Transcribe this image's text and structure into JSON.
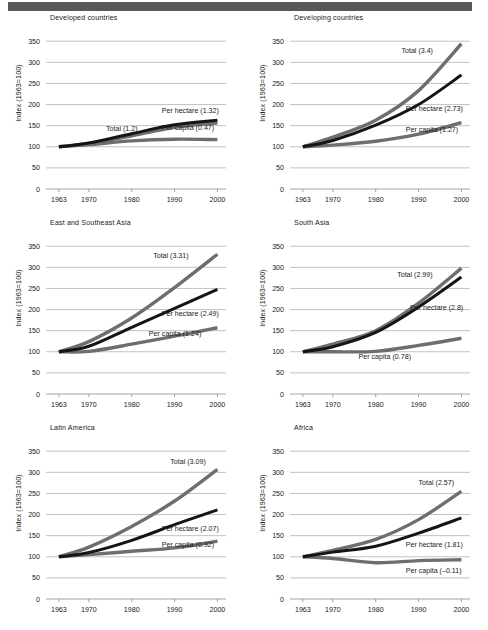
{
  "figure": {
    "y_axis_title": "Index (1963=100)",
    "y_ticks": [
      "0",
      "50",
      "100",
      "150",
      "200",
      "250",
      "300",
      "350"
    ],
    "x_ticks": [
      "1963",
      "1970",
      "1980",
      "1990",
      "2000"
    ],
    "colors": {
      "total": "#6e6e70",
      "per_hectare": "#151515",
      "per_capita": "#6e6e70",
      "gridline": "#a8a8aa",
      "top_rule": "#58585a",
      "text": "#1a1a1a"
    }
  },
  "chart_data": [
    {
      "type": "line",
      "title": "Developed countries",
      "xlabel": "",
      "ylabel": "Index (1963=100)",
      "x": [
        1963,
        1970,
        1980,
        1990,
        2000
      ],
      "xlim": [
        1960,
        2002
      ],
      "ylim": [
        0,
        360
      ],
      "yticks": [
        0,
        50,
        100,
        150,
        200,
        250,
        300,
        350
      ],
      "grid": true,
      "legend": "inline-annotations",
      "series": [
        {
          "name": "Total (1.2)",
          "label": "Total (1.2)",
          "values": [
            100,
            108,
            126,
            146,
            157
          ],
          "label_x": 1974,
          "label_y": 137
        },
        {
          "name": "Per hectare (1.32)",
          "label": "Per hectare (1.32)",
          "values": [
            100,
            109,
            131,
            152,
            163
          ],
          "label_x": 1987,
          "label_y": 180
        },
        {
          "name": "Per capita (0.47)",
          "label": "Per capita (0.47)",
          "values": [
            100,
            105,
            114,
            118,
            117
          ],
          "label_x": 1987,
          "label_y": 139
        }
      ]
    },
    {
      "type": "line",
      "title": "Developing countries",
      "xlabel": "",
      "ylabel": "Index (1963=100)",
      "x": [
        1963,
        1970,
        1980,
        1990,
        2000
      ],
      "xlim": [
        1960,
        2002
      ],
      "ylim": [
        0,
        360
      ],
      "yticks": [
        0,
        50,
        100,
        150,
        200,
        250,
        300,
        350
      ],
      "grid": true,
      "legend": "inline-annotations",
      "series": [
        {
          "name": "Total (3.4)",
          "label": "Total (3.4)",
          "values": [
            100,
            123,
            163,
            233,
            344
          ],
          "label_x": 1986,
          "label_y": 322
        },
        {
          "name": "Per hectare (2.73)",
          "label": "Per hectare (2.73)",
          "values": [
            100,
            115,
            151,
            200,
            270
          ],
          "label_x": 1987,
          "label_y": 185
        },
        {
          "name": "Per capita (1.27)",
          "label": "Per capita (1.27)",
          "values": [
            100,
            104,
            113,
            130,
            157
          ],
          "label_x": 1987,
          "label_y": 136
        }
      ]
    },
    {
      "type": "line",
      "title": "East and Southeast Asia",
      "xlabel": "",
      "ylabel": "Index (1963=100)",
      "x": [
        1963,
        1970,
        1980,
        1990,
        2000
      ],
      "xlim": [
        1960,
        2002
      ],
      "ylim": [
        0,
        360
      ],
      "yticks": [
        0,
        50,
        100,
        150,
        200,
        250,
        300,
        350
      ],
      "grid": true,
      "legend": "inline-annotations",
      "series": [
        {
          "name": "Total (3.31)",
          "label": "Total (3.31)",
          "values": [
            100,
            124,
            180,
            252,
            331
          ],
          "label_x": 1985,
          "label_y": 323
        },
        {
          "name": "Per hectare (2.49)",
          "label": "Per hectare (2.49)",
          "values": [
            100,
            113,
            158,
            203,
            248
          ],
          "label_x": 1987,
          "label_y": 184
        },
        {
          "name": "Per capita (1.24)",
          "label": "Per capita (1.24)",
          "values": [
            100,
            101,
            118,
            137,
            157
          ],
          "label_x": 1984,
          "label_y": 137
        }
      ]
    },
    {
      "type": "line",
      "title": "South Asia",
      "xlabel": "",
      "ylabel": "Index (1963=100)",
      "x": [
        1963,
        1970,
        1980,
        1990,
        2000
      ],
      "xlim": [
        1960,
        2002
      ],
      "ylim": [
        0,
        360
      ],
      "yticks": [
        0,
        50,
        100,
        150,
        200,
        250,
        300,
        350
      ],
      "grid": true,
      "legend": "inline-annotations",
      "series": [
        {
          "name": "Total (2.99)",
          "label": "Total (2.99)",
          "values": [
            100,
            118,
            150,
            215,
            298
          ],
          "label_x": 1985,
          "label_y": 278
        },
        {
          "name": "Per hectare (2.8)",
          "label": "Per hectare (2.8)",
          "values": [
            100,
            112,
            146,
            206,
            277
          ],
          "label_x": 1988,
          "label_y": 198
        },
        {
          "name": "Per capita (0.78)",
          "label": "Per capita (0.78)",
          "values": [
            100,
            100,
            101,
            115,
            132
          ],
          "label_x": 1976,
          "label_y": 84
        }
      ]
    },
    {
      "type": "line",
      "title": "Latin America",
      "xlabel": "",
      "ylabel": "Index (1963=100)",
      "x": [
        1963,
        1970,
        1980,
        1990,
        2000
      ],
      "xlim": [
        1960,
        2002
      ],
      "ylim": [
        0,
        360
      ],
      "yticks": [
        0,
        50,
        100,
        150,
        200,
        250,
        300,
        350
      ],
      "grid": true,
      "legend": "inline-annotations",
      "series": [
        {
          "name": "Total (3.09)",
          "label": "Total (3.09)",
          "values": [
            100,
            123,
            172,
            232,
            307
          ],
          "label_x": 1989,
          "label_y": 320
        },
        {
          "name": "Per hectare (2.07)",
          "label": "Per hectare (2.07)",
          "values": [
            100,
            110,
            139,
            176,
            211
          ],
          "label_x": 1987,
          "label_y": 160
        },
        {
          "name": "Per capita (0.92)",
          "label": "Per capita (0.92)",
          "values": [
            100,
            105,
            113,
            121,
            137
          ],
          "label_x": 1987,
          "label_y": 124
        }
      ]
    },
    {
      "type": "line",
      "title": "Africa",
      "xlabel": "",
      "ylabel": "Index (1963=100)",
      "x": [
        1963,
        1970,
        1980,
        1990,
        2000
      ],
      "xlim": [
        1960,
        2002
      ],
      "ylim": [
        0,
        360
      ],
      "yticks": [
        0,
        50,
        100,
        150,
        200,
        250,
        300,
        350
      ],
      "grid": true,
      "legend": "inline-annotations",
      "series": [
        {
          "name": "Total (2.57)",
          "label": "Total (2.57)",
          "values": [
            100,
            115,
            141,
            188,
            255
          ],
          "label_x": 1990,
          "label_y": 270
        },
        {
          "name": "Per hectare (1.81)",
          "label": "Per hectare (1.81)",
          "values": [
            100,
            111,
            125,
            156,
            192
          ],
          "label_x": 1987,
          "label_y": 122
        },
        {
          "name": "Per capita (-0.11)",
          "label": "Per capita (–0.11)",
          "values": [
            100,
            96,
            86,
            91,
            93
          ],
          "label_x": 1987,
          "label_y": 62
        }
      ]
    }
  ]
}
